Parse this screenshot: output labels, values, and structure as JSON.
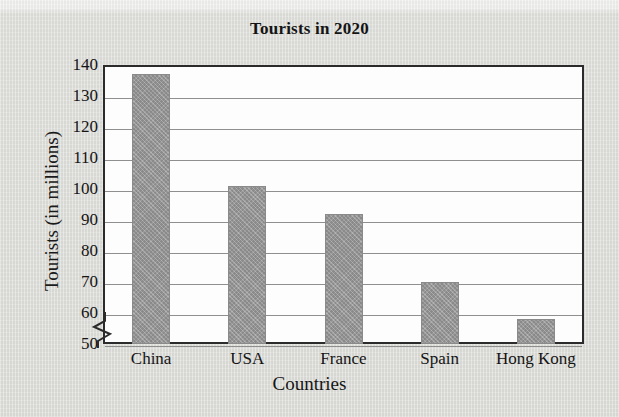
{
  "chart_data": {
    "type": "bar",
    "title": "Tourists in 2020",
    "xlabel": "Countries",
    "ylabel": "Tourists (in millions)",
    "categories": [
      "China",
      "USA",
      "France",
      "Spain",
      "Hong Kong"
    ],
    "values": [
      137,
      101,
      92,
      70,
      58
    ],
    "ylim": [
      50,
      140
    ],
    "ytick_step": 10,
    "yticks": [
      50,
      60,
      70,
      80,
      90,
      100,
      110,
      120,
      130,
      140
    ],
    "axis_break": true,
    "axis_break_note": "y-axis broken below 50",
    "grid": "horizontal",
    "legend": "none",
    "series": [
      {
        "name": "Tourists in 2020",
        "values": [
          137,
          101,
          92,
          70,
          58
        ]
      }
    ],
    "bar_color": "#979797",
    "plot_background": "#fdfdfd",
    "page_background": "#dcddd8",
    "axis_color": "#2b2b2b",
    "gridline_color": "#8f8f8f"
  }
}
